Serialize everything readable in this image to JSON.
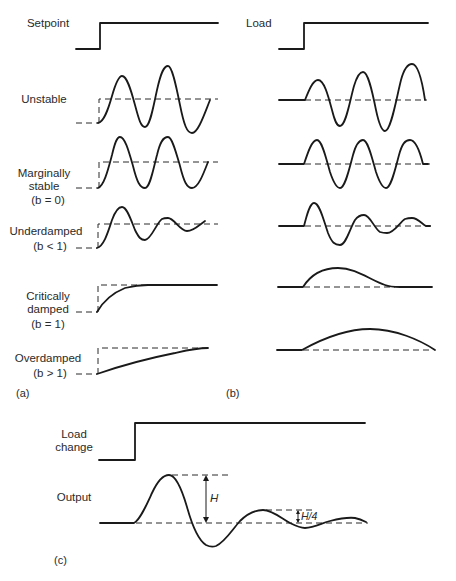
{
  "figure": {
    "panel_a": {
      "tag": "(a)",
      "input_label": "Setpoint",
      "responses": [
        {
          "id": "unstable",
          "label": "Unstable",
          "condition": ""
        },
        {
          "id": "marginal",
          "label": "Marginally\nstable",
          "condition": "(b = 0)"
        },
        {
          "id": "underdamped",
          "label": "Underdamped",
          "condition": "(b < 1)"
        },
        {
          "id": "critical",
          "label": "Critically\ndamped",
          "condition": "(b = 1)"
        },
        {
          "id": "overdamped",
          "label": "Overdamped",
          "condition": "(b > 1)"
        }
      ]
    },
    "panel_b": {
      "tag": "(b)",
      "input_label": "Load"
    },
    "panel_c": {
      "tag": "(c)",
      "input_label": "Load\nchange",
      "output_label": "Output",
      "amplitude_label": "H",
      "quarter_label": "H/4"
    },
    "colors": {
      "line": "#1a1a1a",
      "background": "#ffffff"
    }
  }
}
